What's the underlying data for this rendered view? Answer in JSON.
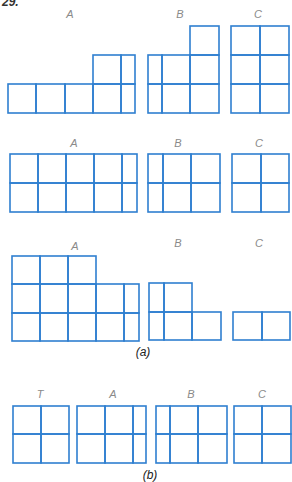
{
  "problem_number": "29.",
  "line_color": "#2f7fd0",
  "label_color": "#8a8a8a",
  "part_a": {
    "caption": "(a)",
    "rows": [
      {
        "figures": [
          {
            "label": "A",
            "label_pos": [
              70,
              18
            ],
            "rects": [
              [
                8,
                84,
                28,
                29
              ],
              [
                36,
                84,
                29,
                29
              ],
              [
                65,
                84,
                28,
                29
              ],
              [
                93,
                84,
                28,
                29
              ],
              [
                121,
                84,
                14,
                29
              ],
              [
                93,
                55,
                28,
                29
              ],
              [
                121,
                55,
                14,
                29
              ]
            ]
          },
          {
            "label": "B",
            "label_pos": [
              180,
              18
            ],
            "rects": [
              [
                190,
                26,
                29,
                29
              ],
              [
                148,
                55,
                14,
                29
              ],
              [
                162,
                55,
                28,
                29
              ],
              [
                190,
                55,
                29,
                29
              ],
              [
                148,
                84,
                14,
                29
              ],
              [
                162,
                84,
                28,
                29
              ],
              [
                190,
                84,
                29,
                29
              ]
            ]
          },
          {
            "label": "C",
            "label_pos": [
              258,
              18
            ],
            "rects": [
              [
                231,
                26,
                29,
                29
              ],
              [
                260,
                26,
                29,
                29
              ],
              [
                231,
                55,
                29,
                29
              ],
              [
                260,
                55,
                29,
                29
              ],
              [
                231,
                84,
                29,
                29
              ],
              [
                260,
                84,
                29,
                29
              ]
            ]
          }
        ]
      },
      {
        "figures": [
          {
            "label": "A",
            "label_pos": [
              74,
              147
            ],
            "rects": [
              [
                10,
                154,
                28,
                29
              ],
              [
                38,
                154,
                28,
                29
              ],
              [
                66,
                154,
                28,
                29
              ],
              [
                94,
                154,
                28,
                29
              ],
              [
                122,
                154,
                15,
                29
              ],
              [
                10,
                183,
                28,
                29
              ],
              [
                38,
                183,
                28,
                29
              ],
              [
                66,
                183,
                28,
                29
              ],
              [
                94,
                183,
                28,
                29
              ],
              [
                122,
                183,
                15,
                29
              ]
            ]
          },
          {
            "label": "B",
            "label_pos": [
              178,
              147
            ],
            "rects": [
              [
                148,
                154,
                15,
                29
              ],
              [
                163,
                154,
                28,
                29
              ],
              [
                191,
                154,
                29,
                29
              ],
              [
                148,
                183,
                15,
                29
              ],
              [
                163,
                183,
                28,
                29
              ],
              [
                191,
                183,
                29,
                29
              ]
            ]
          },
          {
            "label": "C",
            "label_pos": [
              259,
              147
            ],
            "rects": [
              [
                232,
                154,
                29,
                29
              ],
              [
                261,
                154,
                28,
                29
              ],
              [
                232,
                183,
                29,
                29
              ],
              [
                261,
                183,
                28,
                29
              ]
            ]
          }
        ]
      },
      {
        "figures": [
          {
            "label": "A",
            "label_pos": [
              75,
              250
            ],
            "rects": [
              [
                12,
                256,
                28,
                28
              ],
              [
                40,
                256,
                28,
                28
              ],
              [
                68,
                256,
                28,
                28
              ],
              [
                12,
                284,
                28,
                29
              ],
              [
                40,
                284,
                28,
                29
              ],
              [
                68,
                284,
                28,
                29
              ],
              [
                96,
                284,
                28,
                29
              ],
              [
                124,
                284,
                15,
                29
              ],
              [
                12,
                313,
                28,
                28
              ],
              [
                40,
                313,
                28,
                28
              ],
              [
                68,
                313,
                28,
                28
              ],
              [
                96,
                313,
                28,
                28
              ],
              [
                124,
                313,
                15,
                28
              ]
            ]
          },
          {
            "label": "B",
            "label_pos": [
              178,
              247
            ],
            "rects": [
              [
                149,
                283,
                15,
                29
              ],
              [
                164,
                283,
                28,
                29
              ],
              [
                149,
                312,
                15,
                28
              ],
              [
                164,
                312,
                28,
                28
              ],
              [
                192,
                312,
                29,
                28
              ]
            ]
          },
          {
            "label": "C",
            "label_pos": [
              259,
              247
            ],
            "rects": [
              [
                233,
                312,
                29,
                28
              ],
              [
                262,
                312,
                28,
                28
              ]
            ]
          }
        ]
      }
    ]
  },
  "part_b": {
    "caption": "(b)",
    "figures": [
      {
        "label": "T",
        "label_pos": [
          40,
          398
        ],
        "rects": [
          [
            13,
            406,
            28,
            28
          ],
          [
            41,
            406,
            28,
            28
          ],
          [
            13,
            434,
            28,
            29
          ],
          [
            41,
            434,
            28,
            29
          ]
        ]
      },
      {
        "label": "A",
        "label_pos": [
          113,
          398
        ],
        "rects": [
          [
            77,
            406,
            28,
            28
          ],
          [
            105,
            406,
            28,
            28
          ],
          [
            133,
            406,
            13,
            28
          ],
          [
            77,
            434,
            28,
            29
          ],
          [
            105,
            434,
            28,
            29
          ],
          [
            133,
            434,
            13,
            29
          ]
        ]
      },
      {
        "label": "B",
        "label_pos": [
          191,
          398
        ],
        "rects": [
          [
            156,
            406,
            14,
            28
          ],
          [
            170,
            406,
            28,
            28
          ],
          [
            198,
            406,
            29,
            28
          ],
          [
            156,
            434,
            14,
            29
          ],
          [
            170,
            434,
            28,
            29
          ],
          [
            198,
            434,
            29,
            29
          ]
        ]
      },
      {
        "label": "C",
        "label_pos": [
          262,
          398
        ],
        "rects": [
          [
            234,
            406,
            28,
            28
          ],
          [
            262,
            406,
            29,
            28
          ],
          [
            234,
            434,
            28,
            29
          ],
          [
            262,
            434,
            29,
            29
          ]
        ]
      }
    ]
  },
  "captions": {
    "a_pos": [
      143,
      356
    ],
    "b_pos": [
      150,
      479
    ]
  }
}
